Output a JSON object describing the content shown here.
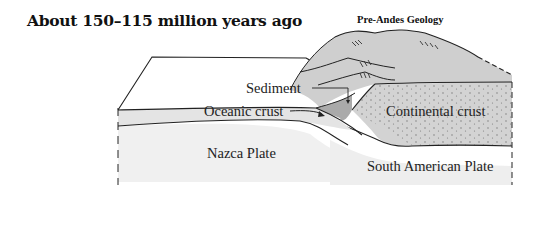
{
  "title": "About 150–115 million years ago",
  "subtitle": "Pre-Andes Geology",
  "labels": {
    "sediment": "Sediment",
    "oceanic_crust": "Oceanic crust",
    "continental_crust": "Continental crust",
    "nazca_plate": "Nazca Plate",
    "south_american_plate": "South American Plate"
  },
  "colors": {
    "line": "#222222",
    "mountain_fill": "#c9c9c9",
    "continental_fill": "#d2d2d2",
    "plate_fill": "#f2f2f2",
    "sediment_fill": "#b0b0b0"
  }
}
